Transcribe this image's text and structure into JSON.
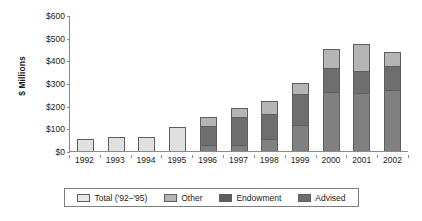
{
  "chart_data": {
    "type": "bar",
    "subtype": "stacked-bar",
    "title": "",
    "xlabel": "",
    "ylabel": "$ Millions",
    "ylim": [
      0,
      600
    ],
    "ytick_step": 100,
    "ytick_labels": [
      "$600",
      "$500",
      "$400",
      "$300",
      "$200",
      "$100",
      "$0"
    ],
    "ytick_values": [
      600,
      500,
      400,
      300,
      200,
      100,
      0
    ],
    "grid": false,
    "legend_position": "below-axis",
    "categories": [
      "1992",
      "1993",
      "1994",
      "1995",
      "1996",
      "1997",
      "1998",
      "1999",
      "2000",
      "2001",
      "2002"
    ],
    "series": [
      {
        "name": "Total ('92-'95)",
        "color": "#e0e0e0",
        "values": [
          55,
          60,
          62,
          105,
          null,
          null,
          null,
          null,
          null,
          null,
          null
        ]
      },
      {
        "name": "Other",
        "color": "#b5b5b5",
        "values": [
          null,
          null,
          null,
          null,
          40,
          40,
          55,
          50,
          85,
          115,
          60
        ]
      },
      {
        "name": "Endowment",
        "color": "#6e6e6e",
        "values": [
          null,
          null,
          null,
          null,
          85,
          125,
          110,
          135,
          105,
          100,
          105
        ]
      },
      {
        "name": "Advised",
        "color": "#808080",
        "values": [
          null,
          null,
          null,
          null,
          25,
          25,
          55,
          115,
          260,
          255,
          270
        ]
      }
    ],
    "totals": [
      55,
      60,
      62,
      105,
      150,
      190,
      220,
      300,
      450,
      470,
      435
    ],
    "annotations": []
  },
  "legend": {
    "items": [
      {
        "label": "Total ('92–'95)",
        "swatch": "#e8e8e8"
      },
      {
        "label": "Other",
        "swatch": "#b5b5b5"
      },
      {
        "label": "Endowment",
        "swatch": "#5e5e5e"
      },
      {
        "label": "Advised",
        "swatch": "#6e6e6e"
      }
    ]
  }
}
